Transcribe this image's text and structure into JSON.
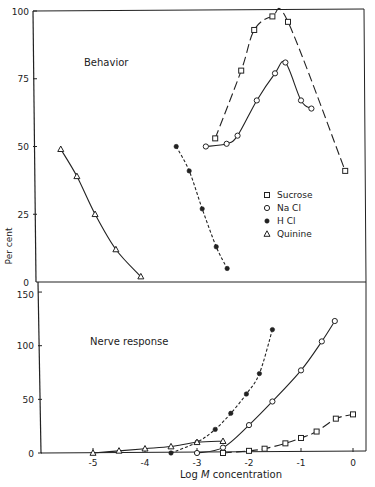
{
  "chart_data": [
    {
      "type": "line",
      "panel": "top",
      "title": "Behavior",
      "xlabel": "Log M concentration",
      "ylabel": "Per cent",
      "xlim": [
        -5.9,
        0.2
      ],
      "ylim": [
        0,
        100
      ],
      "yticks": [
        0,
        25,
        50,
        75,
        100
      ],
      "grid": false,
      "legend_position": "lower right",
      "series": [
        {
          "name": "Sucrose",
          "marker": "square",
          "line": "long-dash",
          "x": [
            -2.65,
            -2.15,
            -1.9,
            -1.55,
            -1.25,
            -0.15
          ],
          "y": [
            53,
            78,
            93,
            98,
            96,
            41
          ]
        },
        {
          "name": "Na Cl",
          "marker": "circle",
          "line": "solid",
          "x": [
            -2.83,
            -2.43,
            -2.22,
            -1.85,
            -1.5,
            -1.3,
            -1.0,
            -0.8
          ],
          "y": [
            50,
            51,
            54,
            67,
            77,
            81,
            67,
            64
          ]
        },
        {
          "name": "H Cl",
          "marker": "dot",
          "line": "short-dash",
          "x": [
            -3.4,
            -3.15,
            -2.9,
            -2.63,
            -2.42
          ],
          "y": [
            50,
            41,
            27,
            13,
            5
          ]
        },
        {
          "name": "Quinine",
          "marker": "triangle",
          "line": "solid",
          "x": [
            -5.62,
            -5.31,
            -4.96,
            -4.56,
            -4.08
          ],
          "y": [
            49,
            39,
            25,
            12,
            2
          ]
        }
      ]
    },
    {
      "type": "line",
      "panel": "bottom",
      "title": "Nerve response",
      "xlabel": "Log M concentration",
      "ylabel": "Per cent",
      "xlim": [
        -5.9,
        0.2
      ],
      "ylim": [
        0,
        160
      ],
      "yticks": [
        0,
        50,
        100,
        150
      ],
      "xticks": [
        -5,
        -4,
        -3,
        -2,
        -1,
        0
      ],
      "grid": false,
      "series": [
        {
          "name": "Sucrose",
          "marker": "square",
          "line": "long-dash",
          "x": [
            -2.5,
            -2.0,
            -1.7,
            -1.3,
            -1.0,
            -0.7,
            -0.33,
            0
          ],
          "y": [
            0,
            2,
            4,
            9,
            14,
            20,
            32,
            36
          ]
        },
        {
          "name": "Na Cl",
          "marker": "circle",
          "line": "solid",
          "x": [
            -3.0,
            -2.5,
            -2.0,
            -1.55,
            -1.0,
            -0.6,
            -0.35
          ],
          "y": [
            0,
            5,
            26,
            48,
            77,
            104,
            123
          ]
        },
        {
          "name": "H Cl",
          "marker": "dot",
          "line": "short-dash",
          "x": [
            -3.5,
            -3.0,
            -2.65,
            -2.35,
            -2.05,
            -1.8,
            -1.55
          ],
          "y": [
            0,
            10,
            22,
            37,
            55,
            74,
            115
          ]
        },
        {
          "name": "Quinine",
          "marker": "triangle",
          "line": "solid",
          "x": [
            -5.0,
            -4.5,
            -4.0,
            -3.5,
            -3.0,
            -2.5
          ],
          "y": [
            0,
            2,
            4,
            6,
            10,
            11
          ]
        }
      ]
    }
  ],
  "labels": {
    "ylabel": "Per cent",
    "xlabel_prefix": "Log ",
    "xlabel_italic": "M",
    "xlabel_suffix": " concentration",
    "top_title": "Behavior",
    "bottom_title": "Nerve response",
    "top_yticks": [
      "0",
      "25",
      "50",
      "75",
      "100"
    ],
    "bottom_yticks": [
      "0",
      "50",
      "100",
      "150"
    ],
    "xticks": [
      "-5",
      "-4",
      "-3",
      "-2",
      "-1",
      "0"
    ]
  },
  "legend": [
    {
      "label": "Sucrose",
      "marker": "square"
    },
    {
      "label": "Na Cl",
      "marker": "circle"
    },
    {
      "label": "H Cl",
      "marker": "dot"
    },
    {
      "label": "Quinine",
      "marker": "triangle"
    }
  ]
}
